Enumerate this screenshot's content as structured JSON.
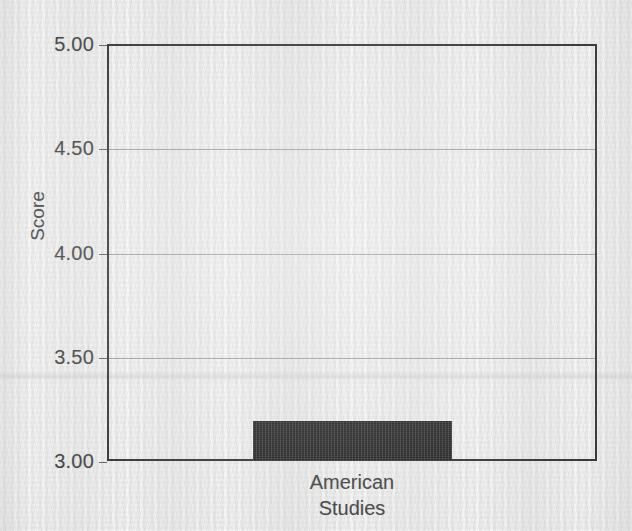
{
  "chart_data": {
    "type": "bar",
    "title": "",
    "subtitle": "",
    "xlabel": "",
    "ylabel": "Score",
    "categories": [
      "American Studies"
    ],
    "category_lines": [
      [
        "American",
        "Studies"
      ]
    ],
    "values": [
      3.19
    ],
    "ylim": [
      3.0,
      5.0
    ],
    "ytick_labels": [
      "3.00",
      "3.50",
      "4.00",
      "4.50",
      "5.00"
    ],
    "ytick_values": [
      3.0,
      3.5,
      4.0,
      4.5,
      5.0
    ],
    "gridline_values": [
      3.5,
      4.0,
      4.5
    ],
    "grid": true,
    "legend": false,
    "legend_position": "none",
    "bar_color": "#262626",
    "frame_color": "#2a2a2a",
    "grid_color": "#8c8c8c",
    "text_color": "#3b3b3b",
    "background_color": "#eaeaea"
  }
}
